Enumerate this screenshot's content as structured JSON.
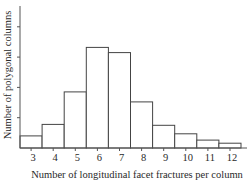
{
  "chart_data": {
    "type": "bar",
    "subtype": "histogram",
    "title": "",
    "xlabel": "Number of longitudinal facet fractures per column",
    "ylabel": "Number of polygonal columns",
    "categories": [
      "3",
      "4",
      "5",
      "6",
      "7",
      "8",
      "9",
      "10",
      "11",
      "12"
    ],
    "values": [
      0.4,
      0.78,
      1.85,
      3.32,
      3.15,
      1.52,
      0.75,
      0.47,
      0.26,
      0.16
    ],
    "value_units": "y-axis tick intervals (y-axis ticks are unlabeled)",
    "y_ticks": [
      1,
      2,
      3,
      4
    ],
    "y_tick_labels": [],
    "ylim": [
      0,
      4.5
    ],
    "grid": false,
    "legend": null,
    "colors": {
      "bar_fill": "#ffffff",
      "bar_stroke": "#444444",
      "axis": "#555555",
      "text": "#2a2a2a"
    }
  }
}
